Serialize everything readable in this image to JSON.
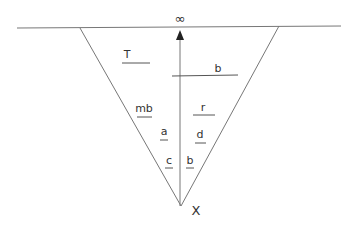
{
  "diagram": {
    "top_label": "∞",
    "bottom_label": "X",
    "labels": [
      {
        "id": "T",
        "text": "T"
      },
      {
        "id": "b_top",
        "text": "b"
      },
      {
        "id": "mb",
        "text": "mb"
      },
      {
        "id": "r",
        "text": "r"
      },
      {
        "id": "a",
        "text": "a"
      },
      {
        "id": "d",
        "text": "d"
      },
      {
        "id": "c",
        "text": "c"
      },
      {
        "id": "b_bottom",
        "text": "b"
      }
    ],
    "colors": {
      "line": "#777777",
      "text": "#333333"
    }
  }
}
